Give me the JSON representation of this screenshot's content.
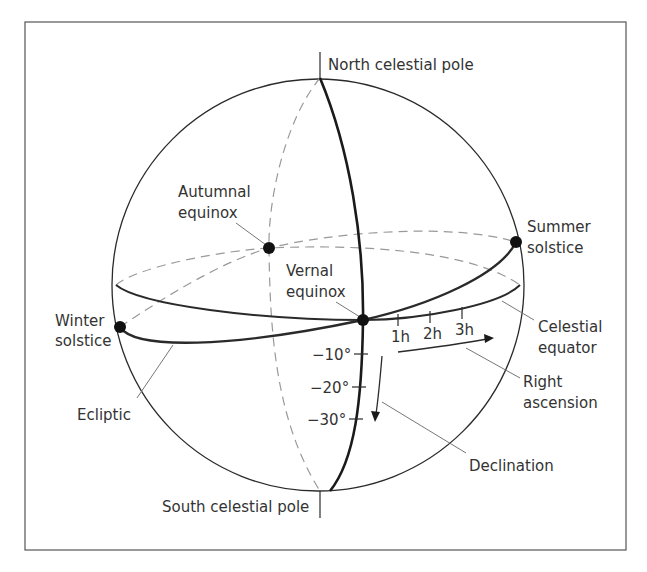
{
  "diagram": {
    "colors": {
      "line": "#2a2a2a",
      "dashed": "#999999",
      "leader": "#777777",
      "text": "#333333",
      "frame": "#555555"
    },
    "labels": {
      "north_pole": "North celestial pole",
      "south_pole": "South celestial pole",
      "autumnal_1": "Autumnal",
      "autumnal_2": "equinox",
      "vernal_1": "Vernal",
      "vernal_2": "equinox",
      "summer_1": "Summer",
      "summer_2": "solstice",
      "winter_1": "Winter",
      "winter_2": "solstice",
      "equator_1": "Celestial",
      "equator_2": "equator",
      "ra_1": "Right",
      "ra_2": "ascension",
      "ecliptic": "Ecliptic",
      "declination": "Declination"
    },
    "ra_ticks": [
      "1h",
      "2h",
      "3h"
    ],
    "dec_ticks": [
      "−10°",
      "−20°",
      "−30°"
    ]
  }
}
